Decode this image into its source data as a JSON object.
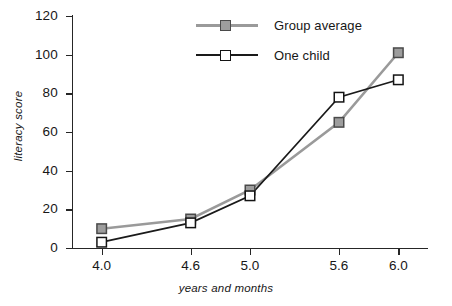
{
  "chart_data": {
    "type": "line",
    "title": "",
    "xlabel": "years and months",
    "ylabel": "literacy score",
    "categories": [
      "4.0",
      "4.6",
      "5.0",
      "5.6",
      "6.0"
    ],
    "x": [
      4.0,
      4.6,
      5.0,
      5.6,
      6.0
    ],
    "xlim": [
      3.8,
      6.2
    ],
    "ylim": [
      0,
      120
    ],
    "yticks": [
      0,
      20,
      40,
      60,
      80,
      100,
      120
    ],
    "grid": false,
    "legend_position": "top-center",
    "series": [
      {
        "name": "Group average",
        "values": [
          10,
          15,
          30,
          65,
          101
        ],
        "color": "#9a9a9a",
        "marker": "filled-square",
        "marker_fill": "#9d9d9d",
        "marker_edge": "#4a4a4a"
      },
      {
        "name": "One child",
        "values": [
          3,
          13,
          27,
          78,
          87
        ],
        "color": "#1a1a1a",
        "marker": "open-square",
        "marker_fill": "#ffffff",
        "marker_edge": "#141414"
      }
    ]
  },
  "axes": {
    "y_tick_labels": [
      "0",
      "20",
      "40",
      "60",
      "80",
      "100",
      "120"
    ],
    "x_tick_labels": [
      "4.0",
      "4.6",
      "5.0",
      "5.6",
      "6.0"
    ],
    "y_title": "literacy score",
    "x_title": "years and months"
  },
  "legend": {
    "items": [
      {
        "label": "Group average",
        "style": "grey"
      },
      {
        "label": "One child",
        "style": "black"
      }
    ]
  },
  "colors": {
    "axis": "#262626",
    "group_average": "#9a9a9a",
    "one_child": "#1a1a1a",
    "background": "#ffffff"
  }
}
